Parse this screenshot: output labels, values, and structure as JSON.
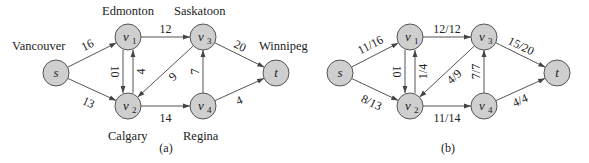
{
  "panels": [
    {
      "id": "a",
      "caption": "(a)",
      "nodes": [
        {
          "id": "s",
          "label": "s",
          "sub": "",
          "x": 56,
          "y": 73,
          "city": "Vancouver",
          "cx": 12,
          "cy": 50
        },
        {
          "id": "v1",
          "label": "v",
          "sub": "1",
          "x": 128,
          "y": 37,
          "city": "Edmonton",
          "cx": 102,
          "cy": 15
        },
        {
          "id": "v2",
          "label": "v",
          "sub": "2",
          "x": 128,
          "y": 106,
          "city": "Calgary",
          "cx": 108,
          "cy": 140
        },
        {
          "id": "v3",
          "label": "v",
          "sub": "3",
          "x": 203,
          "y": 37,
          "city": "Saskatoon",
          "cx": 174,
          "cy": 15
        },
        {
          "id": "v4",
          "label": "v",
          "sub": "4",
          "x": 203,
          "y": 106,
          "city": "Regina",
          "cx": 183,
          "cy": 140
        },
        {
          "id": "t",
          "label": "t",
          "sub": "",
          "x": 276,
          "y": 73,
          "city": "Winnipeg",
          "cx": 259,
          "cy": 50
        }
      ],
      "edges": [
        {
          "from": "s",
          "to": "v1",
          "label": "16"
        },
        {
          "from": "s",
          "to": "v2",
          "label": "13"
        },
        {
          "from": "v1",
          "to": "v2",
          "label": "10"
        },
        {
          "from": "v2",
          "to": "v1",
          "label": "4"
        },
        {
          "from": "v1",
          "to": "v3",
          "label": "12"
        },
        {
          "from": "v3",
          "to": "v2",
          "label": "9"
        },
        {
          "from": "v2",
          "to": "v4",
          "label": "14"
        },
        {
          "from": "v4",
          "to": "v3",
          "label": "7"
        },
        {
          "from": "v3",
          "to": "t",
          "label": "20"
        },
        {
          "from": "v4",
          "to": "t",
          "label": "4"
        }
      ]
    },
    {
      "id": "b",
      "caption": "(b)",
      "nodes": [
        {
          "id": "s",
          "label": "s",
          "sub": "",
          "x": 340,
          "y": 73
        },
        {
          "id": "v1",
          "label": "v",
          "sub": "1",
          "x": 410,
          "y": 37
        },
        {
          "id": "v2",
          "label": "v",
          "sub": "2",
          "x": 410,
          "y": 106
        },
        {
          "id": "v3",
          "label": "v",
          "sub": "3",
          "x": 484,
          "y": 37
        },
        {
          "id": "v4",
          "label": "v",
          "sub": "4",
          "x": 484,
          "y": 106
        },
        {
          "id": "t",
          "label": "t",
          "sub": "",
          "x": 557,
          "y": 73
        }
      ],
      "edges": [
        {
          "from": "s",
          "to": "v1",
          "label": "11/16"
        },
        {
          "from": "s",
          "to": "v2",
          "label": "8/13"
        },
        {
          "from": "v1",
          "to": "v2",
          "label": "10"
        },
        {
          "from": "v2",
          "to": "v1",
          "label": "1/4"
        },
        {
          "from": "v1",
          "to": "v3",
          "label": "12/12"
        },
        {
          "from": "v3",
          "to": "v2",
          "label": "4/9"
        },
        {
          "from": "v2",
          "to": "v4",
          "label": "11/14"
        },
        {
          "from": "v4",
          "to": "v3",
          "label": "7/7"
        },
        {
          "from": "v3",
          "to": "t",
          "label": "15/20"
        },
        {
          "from": "v4",
          "to": "t",
          "label": "4/4"
        }
      ]
    }
  ],
  "colors": {
    "node_fill": "#cfcfcf",
    "stroke": "#555555",
    "text": "#222222"
  }
}
